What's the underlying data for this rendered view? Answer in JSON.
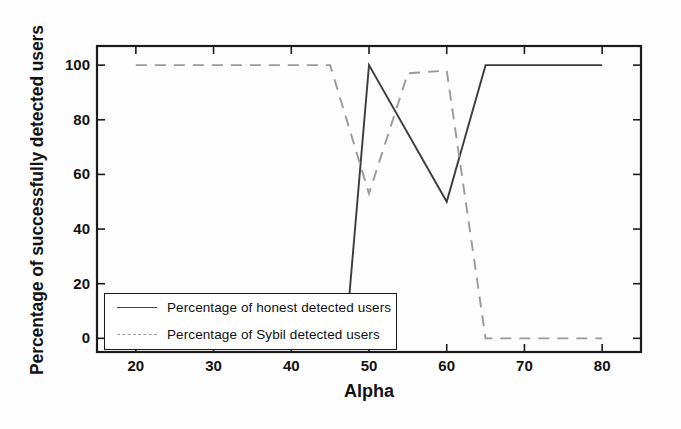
{
  "chart_data": {
    "type": "line",
    "title": "",
    "xlabel": "Alpha",
    "ylabel": "Percentage of successfully detected users",
    "xlim": [
      15,
      85
    ],
    "ylim": [
      -5,
      107
    ],
    "xticks": [
      20,
      30,
      40,
      50,
      60,
      70,
      80
    ],
    "yticks": [
      0,
      20,
      40,
      60,
      80,
      100
    ],
    "grid": false,
    "legend_position": "lower-left-inside",
    "series": [
      {
        "name": "Percentage of honest detected users",
        "style": "solid",
        "color": "#3c3c3c",
        "x": [
          20,
          45,
          47,
          50,
          60,
          65,
          80
        ],
        "y": [
          0,
          0,
          0,
          100,
          50,
          100,
          100
        ]
      },
      {
        "name": "Percentage of Sybil detected users",
        "style": "dashed",
        "color": "#9a9a9a",
        "x": [
          20,
          45,
          50,
          55,
          60,
          65,
          80
        ],
        "y": [
          100,
          100,
          53,
          97,
          98,
          0,
          0
        ]
      }
    ]
  },
  "axes": {
    "x_tick_labels": [
      "20",
      "30",
      "40",
      "50",
      "60",
      "70",
      "80"
    ],
    "y_tick_labels": [
      "0",
      "20",
      "40",
      "60",
      "80",
      "100"
    ],
    "x_axis_title": "Alpha",
    "y_axis_title": "Percentage of successfully detected users"
  },
  "legend": {
    "entries": [
      {
        "label": "Percentage of honest detected users",
        "style": "solid"
      },
      {
        "label": "Percentage of Sybil detected users",
        "style": "dashed"
      }
    ]
  }
}
